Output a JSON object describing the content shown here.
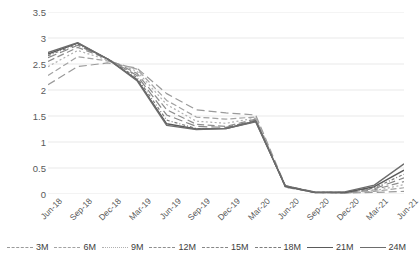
{
  "chart_data": {
    "type": "line",
    "title": "",
    "xlabel": "",
    "ylabel": "Forward SOFR in %",
    "ylim": [
      0,
      3.5
    ],
    "yticks": [
      "0",
      "0.5",
      "1",
      "1.5",
      "2",
      "2.5",
      "3",
      "3.5"
    ],
    "ytick_values": [
      0,
      0.5,
      1,
      1.5,
      2,
      2.5,
      3,
      3.5
    ],
    "grid": "horizontal",
    "legend_position": "bottom",
    "categories": [
      "Jun-18",
      "Sep-18",
      "Dec-18",
      "Mar-19",
      "Jun-19",
      "Sep-19",
      "Dec-19",
      "Mar-20",
      "Jun-20",
      "Sep-20",
      "Dec-20",
      "Mar-21",
      "Jun-21"
    ],
    "series": [
      {
        "name": "3M",
        "dash": "8,4",
        "color": "#9a9a9a",
        "width": 1.2,
        "values": [
          2.1,
          2.45,
          2.52,
          2.42,
          1.93,
          1.62,
          1.56,
          1.52,
          0.16,
          0.04,
          0.02,
          0.03,
          0.05
        ]
      },
      {
        "name": "6M",
        "dash": "6,3",
        "color": "#a3a3a3",
        "width": 1.2,
        "values": [
          2.28,
          2.64,
          2.56,
          2.4,
          1.8,
          1.48,
          1.44,
          1.48,
          0.14,
          0.03,
          0.02,
          0.05,
          0.12
        ]
      },
      {
        "name": "9M",
        "dash": "2,2.4",
        "color": "#b0b0b0",
        "width": 1.2,
        "values": [
          2.45,
          2.76,
          2.58,
          2.36,
          1.72,
          1.4,
          1.36,
          1.46,
          0.13,
          0.03,
          0.02,
          0.06,
          0.18
        ]
      },
      {
        "name": "12M",
        "dash": "7,3.5",
        "color": "#8f8f8f",
        "width": 1.2,
        "values": [
          2.55,
          2.82,
          2.6,
          2.32,
          1.62,
          1.34,
          1.3,
          1.44,
          0.13,
          0.03,
          0.02,
          0.08,
          0.24
        ]
      },
      {
        "name": "15M",
        "dash": "9,4",
        "color": "#878787",
        "width": 1.2,
        "values": [
          2.62,
          2.86,
          2.6,
          2.28,
          1.52,
          1.3,
          1.28,
          1.42,
          0.14,
          0.03,
          0.03,
          0.1,
          0.31
        ]
      },
      {
        "name": "18M",
        "dash": "3,2,1,2",
        "color": "#7d7d7d",
        "width": 1.2,
        "values": [
          2.66,
          2.88,
          2.6,
          2.24,
          1.42,
          1.26,
          1.26,
          1.41,
          0.15,
          0.03,
          0.03,
          0.12,
          0.38
        ]
      },
      {
        "name": "21M",
        "dash": "0",
        "color": "#5a5a5a",
        "width": 1.4,
        "values": [
          2.69,
          2.9,
          2.6,
          2.2,
          1.35,
          1.25,
          1.26,
          1.4,
          0.15,
          0.03,
          0.03,
          0.14,
          0.46
        ]
      },
      {
        "name": "24M",
        "dash": "0",
        "color": "#6d6d6d",
        "width": 1.4,
        "values": [
          2.72,
          2.91,
          2.6,
          2.18,
          1.32,
          1.24,
          1.26,
          1.39,
          0.16,
          0.03,
          0.04,
          0.17,
          0.58
        ]
      }
    ]
  },
  "axis": {
    "y_title": "Forward SOFR in %"
  },
  "colors": {
    "gridline": "#e6e6e6",
    "text": "#595959",
    "axis_text": "#404040"
  }
}
